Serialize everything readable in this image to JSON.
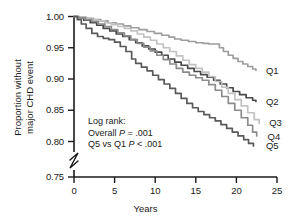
{
  "chart_data": {
    "type": "line",
    "title": "",
    "xlabel": "Years",
    "ylabel_line1": "Proportion without",
    "ylabel_line2": "major CHD event",
    "xlim": [
      0,
      25
    ],
    "ylim": [
      0.75,
      1.0
    ],
    "y_axis_break": {
      "from": 0.75,
      "to": 0.795,
      "present": true
    },
    "grid": false,
    "legend_position": "right-inline",
    "xticks": [
      "0",
      "5",
      "10",
      "15",
      "20",
      "25"
    ],
    "xtick_values": [
      0,
      5,
      10,
      15,
      20,
      25
    ],
    "yticks": [
      "0.75",
      "0.80",
      "0.85",
      "0.90",
      "0.95",
      "1.00"
    ],
    "ytick_values": [
      0.75,
      0.8,
      0.85,
      0.9,
      0.95,
      1.0
    ],
    "series": [
      {
        "name": "Q1",
        "color": "#9d9d9d",
        "label": "Q1",
        "label_x": 22.9,
        "label_y": 0.913,
        "x": [
          0,
          0.6,
          1.5,
          2.4,
          3.3,
          4.2,
          5.2,
          6.1,
          7.0,
          8.0,
          9.0,
          9.9,
          10.8,
          11.7,
          12.4,
          13.2,
          14.1,
          15.0,
          15.9,
          16.6,
          17.3,
          17.9,
          18.4,
          19.0,
          19.6,
          20.2,
          20.8,
          21.4,
          22.0,
          22.4
        ],
        "y": [
          1.0,
          0.999,
          0.997,
          0.995,
          0.993,
          0.99,
          0.988,
          0.985,
          0.982,
          0.979,
          0.976,
          0.973,
          0.97,
          0.967,
          0.964,
          0.962,
          0.96,
          0.958,
          0.957,
          0.956,
          0.956,
          0.95,
          0.944,
          0.938,
          0.933,
          0.928,
          0.924,
          0.92,
          0.916,
          0.914
        ]
      },
      {
        "name": "Q2",
        "color": "#4a4a4a",
        "label": "Q2",
        "label_x": 22.9,
        "label_y": 0.864,
        "x": [
          0,
          0.5,
          1.2,
          2.0,
          2.8,
          3.6,
          4.4,
          5.2,
          6.0,
          6.8,
          7.6,
          8.4,
          9.2,
          10.0,
          10.8,
          11.6,
          12.4,
          13.2,
          14.0,
          14.8,
          15.6,
          16.4,
          17.2,
          18.0,
          18.8,
          19.6,
          20.4,
          21.2,
          22.0,
          22.4
        ],
        "y": [
          1.0,
          0.998,
          0.994,
          0.99,
          0.986,
          0.981,
          0.977,
          0.972,
          0.968,
          0.963,
          0.958,
          0.953,
          0.948,
          0.943,
          0.938,
          0.932,
          0.927,
          0.922,
          0.917,
          0.912,
          0.907,
          0.903,
          0.898,
          0.892,
          0.886,
          0.88,
          0.875,
          0.87,
          0.866,
          0.864
        ]
      },
      {
        "name": "Q3",
        "color": "#c2c2c2",
        "label": "Q3",
        "label_x": 23.3,
        "label_y": 0.829,
        "x": [
          0,
          0.6,
          1.4,
          2.2,
          3.0,
          3.8,
          4.6,
          5.4,
          6.2,
          7.0,
          7.8,
          8.6,
          9.4,
          10.2,
          11.0,
          11.8,
          12.6,
          13.4,
          14.2,
          15.0,
          15.8,
          16.6,
          17.4,
          18.2,
          19.0,
          19.8,
          20.6,
          21.4,
          22.2,
          22.8
        ],
        "y": [
          1.0,
          0.999,
          0.997,
          0.995,
          0.993,
          0.99,
          0.987,
          0.984,
          0.981,
          0.977,
          0.972,
          0.967,
          0.962,
          0.956,
          0.95,
          0.944,
          0.937,
          0.93,
          0.923,
          0.917,
          0.911,
          0.904,
          0.896,
          0.887,
          0.877,
          0.867,
          0.857,
          0.846,
          0.835,
          0.829
        ]
      },
      {
        "name": "Q4",
        "color": "#8c8c8c",
        "label": "Q4",
        "label_x": 23.1,
        "label_y": 0.808,
        "x": [
          0,
          0.6,
          1.4,
          2.2,
          3.0,
          3.8,
          4.6,
          5.4,
          6.2,
          7.0,
          7.8,
          8.6,
          9.4,
          10.2,
          11.0,
          11.8,
          12.6,
          13.4,
          14.2,
          15.0,
          15.8,
          16.6,
          17.4,
          18.2,
          19.0,
          19.8,
          20.6,
          21.4,
          22.0,
          22.5
        ],
        "y": [
          1.0,
          0.998,
          0.995,
          0.992,
          0.988,
          0.984,
          0.979,
          0.974,
          0.969,
          0.963,
          0.957,
          0.951,
          0.945,
          0.938,
          0.931,
          0.924,
          0.917,
          0.911,
          0.906,
          0.902,
          0.898,
          0.891,
          0.882,
          0.872,
          0.861,
          0.85,
          0.838,
          0.826,
          0.815,
          0.809
        ]
      },
      {
        "name": "Q5",
        "color": "#5a5a5a",
        "label": "Q5",
        "label_x": 22.9,
        "label_y": 0.793,
        "x": [
          0,
          0.4,
          0.9,
          1.5,
          2.2,
          2.9,
          3.6,
          4.3,
          5.0,
          5.7,
          6.4,
          7.1,
          7.6,
          8.3,
          9.0,
          9.7,
          10.4,
          11.1,
          11.8,
          12.5,
          13.2,
          13.9,
          14.6,
          15.3,
          16.0,
          16.7,
          17.4,
          18.1,
          18.8,
          19.5,
          20.2,
          20.9,
          21.5,
          22.1
        ],
        "y": [
          1.0,
          0.995,
          0.988,
          0.981,
          0.973,
          0.968,
          0.965,
          0.963,
          0.959,
          0.952,
          0.944,
          0.932,
          0.925,
          0.919,
          0.913,
          0.906,
          0.899,
          0.892,
          0.885,
          0.877,
          0.869,
          0.861,
          0.854,
          0.848,
          0.843,
          0.838,
          0.833,
          0.827,
          0.821,
          0.815,
          0.809,
          0.803,
          0.797,
          0.793
        ]
      }
    ],
    "annotations": {
      "line1": "Log rank:",
      "line2_pre": "Overall ",
      "line2_italic": "P",
      "line2_post": " = .001",
      "line3_pre": "Q5 vs Q1 ",
      "line3_italic": "P",
      "line3_post": " < .001"
    }
  }
}
